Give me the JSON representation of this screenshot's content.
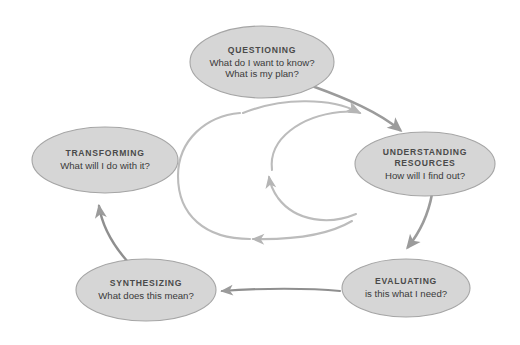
{
  "diagram": {
    "type": "cycle-diagram",
    "colors": {
      "node_fill": "#d6d6d6",
      "node_stroke": "#9a9a9a",
      "node_title_text": "#4a4a4a",
      "node_subtitle_text": "#3a3a3a",
      "arrow": "#9b9b9b",
      "loop_arrow": "#b9b9b9",
      "background": "#ffffff"
    },
    "nodes": [
      {
        "id": "questioning",
        "title": "QUESTIONING",
        "lines": [
          "What do I want to know?",
          "What is my plan?"
        ],
        "cx": 262,
        "cy": 62,
        "rx": 72,
        "ry": 36
      },
      {
        "id": "understanding-resources",
        "title": "UNDERSTANDING RESOURCES",
        "title_lines": [
          "UNDERSTANDING",
          "RESOURCES"
        ],
        "lines": [
          "How will I find out?"
        ],
        "cx": 425,
        "cy": 164,
        "rx": 70,
        "ry": 32
      },
      {
        "id": "evaluating",
        "title": "EVALUATING",
        "lines": [
          "is this what I need?"
        ],
        "cx": 406,
        "cy": 288,
        "rx": 64,
        "ry": 29
      },
      {
        "id": "synthesizing",
        "title": "SYNTHESIZING",
        "lines": [
          "What does this mean?"
        ],
        "cx": 146,
        "cy": 290,
        "rx": 70,
        "ry": 31
      },
      {
        "id": "transforming",
        "title": "TRANSFORMING",
        "lines": [
          "What will I do with it?"
        ],
        "cx": 105,
        "cy": 160,
        "rx": 73,
        "ry": 33
      }
    ],
    "connections": [
      {
        "id": "questioning-to-understanding",
        "from": "questioning",
        "to": "understanding-resources",
        "direction": "clockwise-curve"
      },
      {
        "id": "understanding-to-evaluating",
        "from": "understanding-resources",
        "to": "evaluating",
        "direction": "clockwise-curve"
      },
      {
        "id": "evaluating-to-synthesizing",
        "from": "evaluating",
        "to": "synthesizing",
        "direction": "leftward"
      },
      {
        "id": "synthesizing-to-transforming",
        "from": "synthesizing",
        "to": "transforming",
        "direction": "upward-curve"
      },
      {
        "id": "outer-feedback-loop",
        "from": "understanding-resources",
        "to": "understanding-resources",
        "direction": "counter-clockwise-loop"
      },
      {
        "id": "inner-feedback-loop",
        "from": "understanding-resources",
        "to": "understanding-resources",
        "direction": "counter-clockwise-loop"
      }
    ]
  }
}
